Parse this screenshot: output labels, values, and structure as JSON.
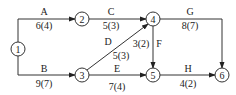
{
  "diagram": {
    "type": "activity-on-arrow network",
    "nodes": [
      {
        "id": "1",
        "label": "1",
        "x": 18,
        "y": 49
      },
      {
        "id": "2",
        "label": "2",
        "x": 82,
        "y": 19
      },
      {
        "id": "3",
        "label": "3",
        "x": 82,
        "y": 75
      },
      {
        "id": "4",
        "label": "4",
        "x": 153,
        "y": 19
      },
      {
        "id": "5",
        "label": "5",
        "x": 153,
        "y": 75
      },
      {
        "id": "6",
        "label": "6",
        "x": 222,
        "y": 75
      }
    ],
    "activities": [
      {
        "name": "A",
        "duration": "6(4)",
        "from": "1",
        "to": "2"
      },
      {
        "name": "B",
        "duration": "9(7)",
        "from": "1",
        "to": "3"
      },
      {
        "name": "C",
        "duration": "5(3)",
        "from": "2",
        "to": "4"
      },
      {
        "name": "D",
        "duration": "5(3)",
        "from": "3",
        "to": "4"
      },
      {
        "name": "E",
        "duration": "7(4)",
        "from": "3",
        "to": "5"
      },
      {
        "name": "F",
        "duration": "3(2)",
        "from": "4",
        "to": "5"
      },
      {
        "name": "G",
        "duration": "8(7)",
        "from": "4",
        "to": "6"
      },
      {
        "name": "H",
        "duration": "4(2)",
        "from": "5",
        "to": "6"
      }
    ]
  }
}
